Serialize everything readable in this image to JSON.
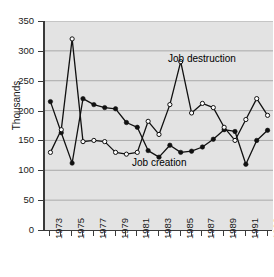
{
  "chart_data": {
    "type": "line",
    "title": "",
    "xlabel": "",
    "ylabel": "Thousands",
    "ylim": [
      0,
      350
    ],
    "ytick_step": 50,
    "yticks": [
      0,
      50,
      100,
      150,
      200,
      250,
      300,
      350
    ],
    "grid": true,
    "grid_axis": "y",
    "legend_position": "inline-annotations",
    "x": [
      1973,
      1974,
      1975,
      1976,
      1977,
      1978,
      1979,
      1980,
      1981,
      1982,
      1983,
      1984,
      1985,
      1986,
      1987,
      1988,
      1989,
      1990,
      1991,
      1992,
      1993
    ],
    "xticks": [
      1973,
      1975,
      1977,
      1979,
      1981,
      1983,
      1985,
      1987,
      1989,
      1991,
      1993
    ],
    "xticklabels": [
      "1973",
      "1975",
      "1977",
      "1979",
      "1981",
      "1983",
      "1985",
      "1987",
      "1989",
      "1991",
      "1993"
    ],
    "series": [
      {
        "name": "Job creation",
        "marker": "filled-circle",
        "color": "#111111",
        "values": [
          215,
          163,
          112,
          220,
          210,
          205,
          203,
          180,
          172,
          133,
          122,
          142,
          130,
          132,
          139,
          152,
          168,
          165,
          110,
          150,
          167
        ]
      },
      {
        "name": "Job destruction",
        "marker": "open-circle",
        "color": "#111111",
        "values": [
          130,
          168,
          320,
          148,
          150,
          148,
          130,
          127,
          130,
          182,
          160,
          210,
          282,
          196,
          212,
          205,
          172,
          150,
          185,
          220,
          192
        ]
      }
    ],
    "annotations": [
      {
        "text": "Job destruction",
        "series": "Job destruction"
      },
      {
        "text": "Job creation",
        "series": "Job creation"
      }
    ]
  },
  "axes": {
    "y_title": "Thousands"
  }
}
